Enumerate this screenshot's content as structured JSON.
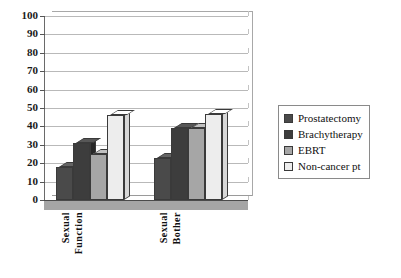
{
  "chart_data": {
    "type": "bar",
    "title": "",
    "subtitle": "",
    "xlabel": "",
    "ylabel": "",
    "categories": [
      "Sexual Function",
      "Sexual Bother"
    ],
    "category_lines": [
      [
        "Sexual",
        "Function"
      ],
      [
        "Sexual",
        "Bother"
      ]
    ],
    "series": [
      {
        "name": "Prostatectomy",
        "values": [
          18,
          23
        ],
        "color": "#4a4a4a"
      },
      {
        "name": "Brachytherapy",
        "values": [
          31,
          39
        ],
        "color": "#3d3d3d"
      },
      {
        "name": "EBRT",
        "values": [
          25,
          39
        ],
        "color": "#a6a6a6"
      },
      {
        "name": "Non-cancer pt",
        "values": [
          46,
          47
        ],
        "color": "#ededed"
      }
    ],
    "ylim": [
      0,
      100
    ],
    "ytick_step": 10,
    "yticks": [
      "100",
      "90",
      "80",
      "70",
      "60",
      "50",
      "40",
      "30",
      "20",
      "10",
      "0"
    ],
    "grid": true,
    "legend_position": "right",
    "style": "3d-column"
  },
  "legend": {
    "items": [
      {
        "label": "Prostatectomy"
      },
      {
        "label": "Brachytherapy"
      },
      {
        "label": "EBRT"
      },
      {
        "label": "Non-cancer pt"
      }
    ]
  }
}
